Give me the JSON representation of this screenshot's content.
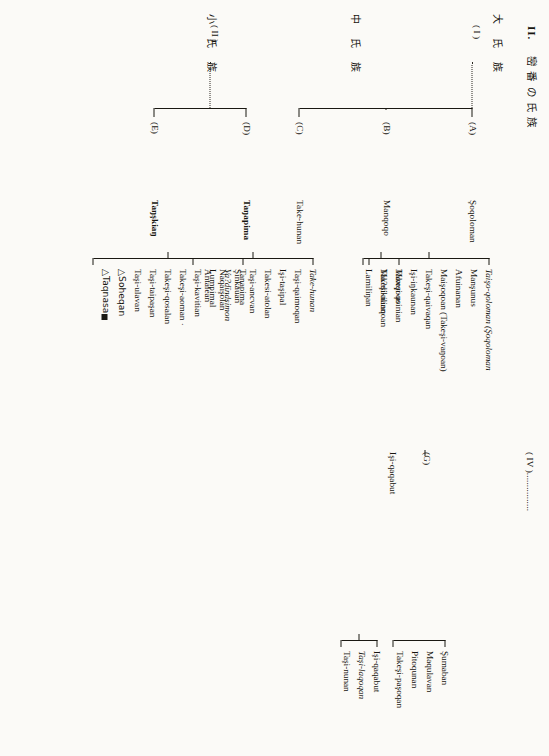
{
  "document": {
    "title_number": "II.",
    "title_cjk": "巒 番 の 氏 族",
    "column_headers": [
      "大 氏 族",
      "中 氏 族",
      "小 氏 族"
    ]
  },
  "tree": {
    "roots": [
      {
        "id": "I",
        "label": "( I )"
      },
      {
        "id": "II",
        "label": "( II )"
      },
      {
        "id": "IV",
        "label": "( IV )",
        "leader": "................"
      }
    ],
    "middle_clans": [
      {
        "code": "(A)",
        "name": "Şoqoloman"
      },
      {
        "code": "(B)",
        "name": "Manqoqo"
      },
      {
        "code": "(C)",
        "name": "Take-hunan"
      },
      {
        "code": "(D)",
        "name": "Taŋapima"
      },
      {
        "code": "(E)",
        "name": "Taŋşkiaŋ"
      },
      {
        "code": "(G)",
        "name": "Işi-qaqabut"
      }
    ],
    "small_clan_groups": [
      {
        "parent": "(A)",
        "members": [
          {
            "name": "Taişo-qoloman (Şoqoloman",
            "italic_part": "Taişo-qoloman",
            "style": "italic-head"
          },
          {
            "name": "Manşunus",
            "style": "normal"
          },
          {
            "name": "Afuinanan",
            "style": "normal"
          },
          {
            "name": "Maişoqoan (Takeşi-vaŋoan)",
            "style": "normal"
          },
          {
            "name": "Takeşi-qaivaqan",
            "style": "normal"
          },
          {
            "name": "Işi-iŋkaunan",
            "style": "normal"
          },
          {
            "name": "Takeşi-usinian",
            "style": "normal"
          },
          {
            "name": "Takeşi-nanqoan",
            "style": "normal"
          }
        ]
      },
      {
        "parent": "(B)",
        "members": [
          {
            "name": "Manqoqo",
            "style": "italic"
          },
          {
            "name": "Ma?dikilian",
            "style": "normal"
          },
          {
            "name": "Lamiliŋan",
            "style": "normal"
          }
        ]
      },
      {
        "parent": "(C)",
        "members": [
          {
            "name": "Take-hunan",
            "style": "italic"
          },
          {
            "name": "Taşi-qaimoqan",
            "style": "normal"
          },
          {
            "name": "Işi-taşipal",
            "style": "normal"
          },
          {
            "name": "Takesi-atolan",
            "style": "normal"
          },
          {
            "name": "Taşi-ancvan",
            "style": "normal"
          },
          {
            "name": "Şinkauan",
            "style": "normal"
          },
          {
            "name": "Naqaişolan",
            "style": "normal"
          },
          {
            "name": "Antalean",
            "style": "normal"
          }
        ]
      },
      {
        "parent": "(D)/(E)",
        "members": [
          {
            "name": "Tanapima",
            "style": "normal"
          },
          {
            "name": "Va?dïndsimon",
            "style": "italic"
          },
          {
            "name": "Lumpimal",
            "style": "normal"
          },
          {
            "name": "Taşi-kavitian",
            "style": "normal"
          },
          {
            "name": "Takeşi-aoman ·",
            "style": "normal"
          },
          {
            "name": "Takeşi-qosalan",
            "style": "normal"
          },
          {
            "name": "Taşi-taipaşan",
            "style": "normal"
          },
          {
            "name": "Taşi-ulavan",
            "style": "normal"
          },
          {
            "name": "△Soheqan",
            "style": "normal"
          },
          {
            "name": "△Taqnasa",
            "style": "normal",
            "trailing_blob": true
          }
        ]
      },
      {
        "parent": "(G)-upper",
        "members": [
          {
            "name": "Şumaban",
            "style": "normal"
          },
          {
            "name": "Maqulavan",
            "style": "normal"
          },
          {
            "name": "Pitoqunan",
            "style": "normal"
          },
          {
            "name": "Takeşi-paşoqan",
            "style": "normal"
          }
        ]
      },
      {
        "parent": "(G)-lower",
        "members": [
          {
            "name": "Işi-qaqabut",
            "style": "normal"
          },
          {
            "name": "Taşi-laqoqan",
            "style": "italic"
          },
          {
            "name": "Taşi-nunan",
            "style": "normal"
          }
        ]
      }
    ]
  }
}
